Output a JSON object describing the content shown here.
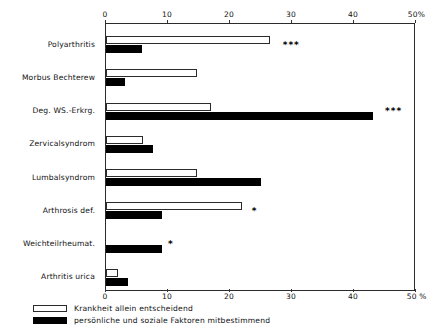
{
  "chart_data": {
    "type": "bar",
    "orientation": "horizontal",
    "title": "",
    "xlabel": "",
    "ylabel": "",
    "xlim": [
      0,
      50
    ],
    "xtick_labels": [
      "0",
      "10",
      "20",
      "30",
      "40",
      "50%"
    ],
    "xticks": [
      0,
      10,
      20,
      30,
      40,
      50
    ],
    "xtick_labels_bottom": [
      "0",
      "10",
      "20",
      "30",
      "40",
      "50 %"
    ],
    "grid": false,
    "legend_position": "bottom-left",
    "categories": [
      "Polyarthritis",
      "Morbus Bechterew",
      "Deg. WS.-Erkrg.",
      "Zervicalsyndrom",
      "Lumbalsyndrom",
      "Arthrosis def.",
      "Weichteilrheumat.",
      "Arthritis urica"
    ],
    "series": [
      {
        "name": "Krankheit allein entscheidend",
        "color": "#ffffff",
        "values": [
          26.5,
          14.7,
          17.0,
          6.0,
          14.7,
          22.0,
          0.0,
          2.0
        ]
      },
      {
        "name": "persönliche und soziale Faktoren mitbestimmend",
        "color": "#000000",
        "values": [
          5.8,
          3.0,
          43.0,
          7.5,
          25.0,
          9.0,
          9.0,
          3.5
        ]
      }
    ],
    "annotations": [
      {
        "category": "Polyarthritis",
        "text": "***",
        "at_value": 28.5,
        "row": 0
      },
      {
        "category": "Deg. WS.-Erkrg.",
        "text": "***",
        "at_value": 45.0,
        "row": 2
      },
      {
        "category": "Arthrosis def.",
        "text": "*",
        "at_value": 23.5,
        "row": 5
      },
      {
        "category": "Weichteilrheumat.",
        "text": "*",
        "at_value": 10.0,
        "row": 6
      }
    ]
  },
  "legend": {
    "items": [
      {
        "label": "Krankheit allein entscheidend",
        "swatch": "light"
      },
      {
        "label": "persönliche und soziale Faktoren mitbestimmend",
        "swatch": "dark"
      }
    ]
  }
}
